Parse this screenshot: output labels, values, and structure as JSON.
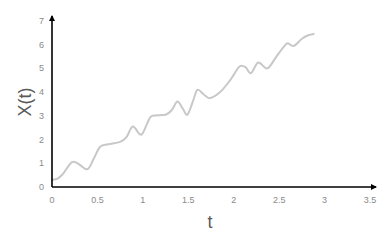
{
  "chart_data": {
    "type": "line",
    "title": "",
    "xlabel": "t",
    "ylabel": "X(t)",
    "xlim": [
      0,
      3.5
    ],
    "ylim": [
      0,
      7
    ],
    "xticks": [
      0,
      0.5,
      1,
      1.5,
      2,
      2.5,
      3,
      3.5
    ],
    "xtick_labels": [
      "0",
      "0.5",
      "1",
      "1.5",
      "2",
      "2.5",
      "3",
      "3.5"
    ],
    "yticks": [
      0,
      1,
      2,
      3,
      4,
      5,
      6,
      7
    ],
    "ytick_labels": [
      "0",
      "1",
      "2",
      "3",
      "4",
      "5",
      "6",
      "7"
    ],
    "grid": false,
    "legend": null,
    "series": [
      {
        "name": "X(t)",
        "color": "#c8c8c8",
        "x": [
          0,
          0.06,
          0.12,
          0.22,
          0.3,
          0.39,
          0.46,
          0.53,
          0.62,
          0.75,
          0.82,
          0.89,
          0.98,
          1.05,
          1.1,
          1.25,
          1.32,
          1.38,
          1.44,
          1.49,
          1.55,
          1.6,
          1.67,
          1.74,
          1.85,
          1.96,
          2.02,
          2.07,
          2.13,
          2.19,
          2.27,
          2.37,
          2.47,
          2.57,
          2.6,
          2.66,
          2.75,
          2.82,
          2.88
        ],
        "values": [
          0.3,
          0.35,
          0.55,
          1.05,
          0.95,
          0.75,
          1.2,
          1.7,
          1.8,
          1.9,
          2.1,
          2.55,
          2.2,
          2.7,
          3.0,
          3.05,
          3.25,
          3.6,
          3.3,
          3.05,
          3.6,
          4.1,
          3.9,
          3.75,
          4.0,
          4.5,
          4.85,
          5.1,
          5.05,
          4.8,
          5.25,
          5.0,
          5.5,
          6.0,
          6.05,
          5.95,
          6.25,
          6.4,
          6.45
        ]
      }
    ]
  },
  "axes": {
    "x_title": "t",
    "y_title": "X(t)"
  },
  "colors": {
    "axis": "#000000",
    "tick_label": "#8a8a8a",
    "axis_title": "#595959",
    "series": "#c8c8c8",
    "background": "#ffffff"
  }
}
